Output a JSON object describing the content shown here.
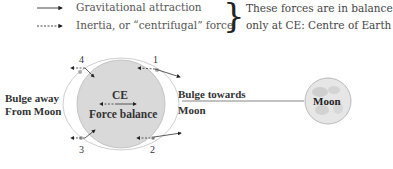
{
  "legend": {
    "items": [
      {
        "line_style": "solid",
        "label": "Gravitational attraction"
      },
      {
        "line_style": "dashed",
        "label": "Inertia, or “centrifugal” force"
      }
    ],
    "note_line1": "These forces are in balance",
    "note_line2": "only at CE: Centre of Earth"
  },
  "earth": {
    "center_label": "CE",
    "balance_label": "Force balance",
    "points": [
      "1",
      "2",
      "3",
      "4"
    ],
    "fill_color": "#d9d9d9"
  },
  "labels": {
    "bulge_away_line1": "Bulge away",
    "bulge_away_line2": "From Moon",
    "bulge_towards_line1": "Bulge towards",
    "bulge_towards_line2": "Moon"
  },
  "moon": {
    "label": "Moon",
    "fill_color": "#e6e6e6"
  }
}
